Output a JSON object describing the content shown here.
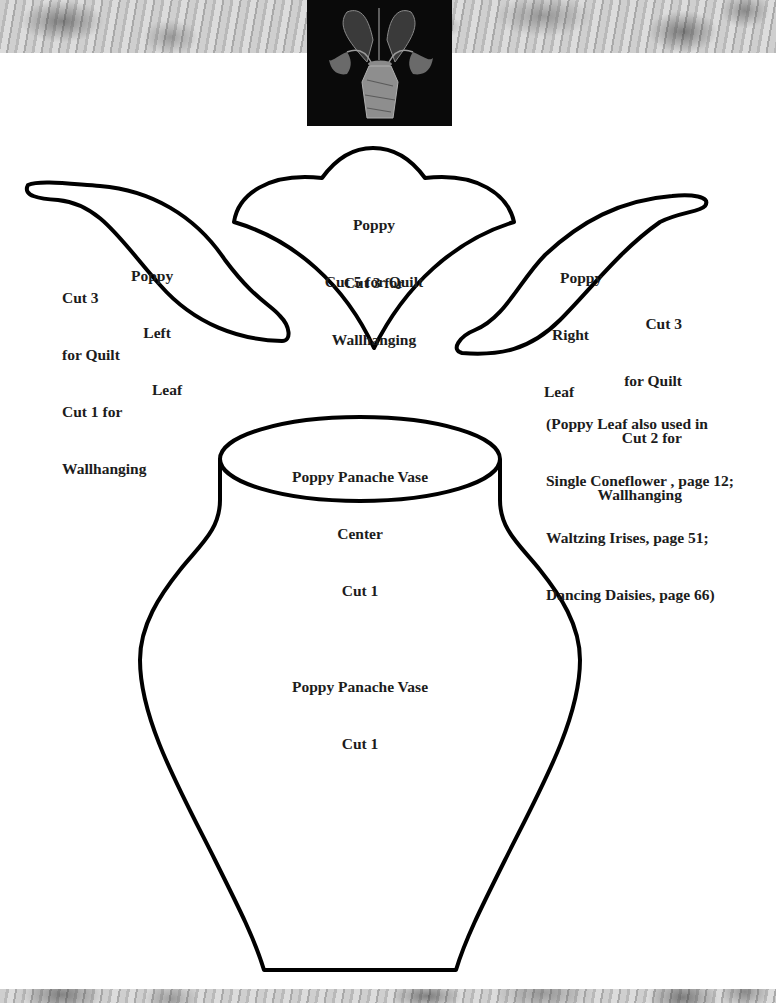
{
  "header": {
    "thumbnail": "poppy-panache-quilt-thumbnail"
  },
  "colors": {
    "outline": "#000000",
    "text": "#1c1c1c",
    "band": "#c4c4c4",
    "thumbnail_bg": "#0a0a0a"
  },
  "patterns": {
    "left_leaf": {
      "name": "Poppy Left Leaf",
      "title_lines": [
        "Poppy",
        "Left",
        "Leaf"
      ],
      "cut_lines": [
        "Cut 3",
        "for Quilt",
        "Cut 1 for",
        "Wallhanging"
      ]
    },
    "flower": {
      "title_lines": [
        "Poppy",
        "Cut 5 for Quilt"
      ],
      "cut_lines": [
        "Cut 3 for",
        "Wallhanging"
      ]
    },
    "right_leaf": {
      "name": "Poppy Right Leaf",
      "title_lines": [
        "Poppy",
        "Right",
        "Leaf"
      ],
      "cut_lines": [
        "Cut 3",
        "for Quilt",
        "Cut 2 for",
        "Wallhanging"
      ]
    },
    "note": {
      "lines": [
        "(Poppy Leaf also used in",
        "Single Coneflower , page 12;",
        "Waltzing Irises, page 51;",
        "Dancing Daisies, page 66)"
      ]
    },
    "vase_center": {
      "lines": [
        "Poppy Panache Vase",
        "Center",
        "Cut 1"
      ]
    },
    "vase": {
      "lines": [
        "Poppy Panache Vase",
        "Cut 1"
      ]
    }
  }
}
